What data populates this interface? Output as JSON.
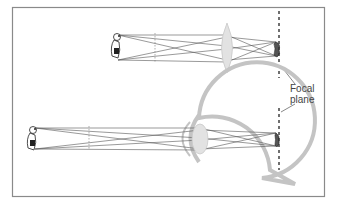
{
  "diagram": {
    "title": "",
    "panels": [
      {
        "id": "camera-lens",
        "description": "Object (dog) imaged by a convex lens onto the focal plane, inverted"
      },
      {
        "id": "eye",
        "description": "Object (dog) imaged by the eye's lens onto the retina at the focal plane, inverted"
      }
    ],
    "labels": {
      "focal_plane_line1": "Focal",
      "focal_plane_line2": "plane"
    },
    "colors": {
      "frame": "#8a8a8a",
      "rays": "#555555",
      "eye_outline": "#c4c4c4",
      "lens_fill": "#e2e2e2",
      "focal_plane": "#333333",
      "text": "#444444"
    }
  }
}
